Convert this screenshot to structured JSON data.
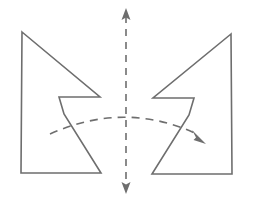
{
  "figure": {
    "title": "Reflection symmetry of a notched arrow polygon about a vertical axis",
    "caption": "",
    "background_color": "#ffffff",
    "stroke_color": "#6e6e6e",
    "stroke_width": 1.6,
    "canvas": {
      "width": 253,
      "height": 210
    }
  },
  "shapes": {
    "left_polygon": {
      "label": "left-arrow-polygon",
      "role": "original figure",
      "points": "22,32 100,97 59,97 64,114 101,173 21,173",
      "vertex_count": 6
    },
    "right_polygon": {
      "label": "right-arrow-polygon",
      "role": "mirrored image",
      "points": "231,34 153,98 194,98 189,115 152,174 232,174",
      "vertex_count": 6
    }
  },
  "axis": {
    "label": "mirror-line",
    "orientation": "vertical",
    "x": 126,
    "top_y": 8,
    "bottom_y": 194,
    "dash_pattern": "7 6",
    "arrow_top": {
      "tip_x": 126,
      "tip_y": 8,
      "label": "axis-arrow-up"
    },
    "arrow_bottom": {
      "tip_x": 126,
      "tip_y": 194,
      "label": "axis-arrow-down"
    }
  },
  "arc": {
    "label": "reflection-arc",
    "description": "dashed arc showing the flip from left figure to right figure",
    "start_x": 50,
    "start_y": 134,
    "control_x": 126,
    "control_y": 100,
    "end_x": 200,
    "end_y": 136,
    "dash_pattern": "8 6",
    "arrow_end": {
      "tip_x": 205,
      "tip_y": 143,
      "label": "arc-arrow-end"
    }
  }
}
